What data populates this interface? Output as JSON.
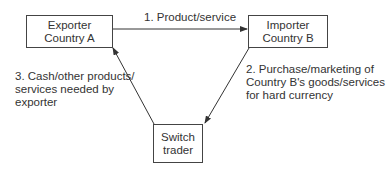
{
  "nodes": {
    "exporter": {
      "line1": "Exporter",
      "line2": "Country A"
    },
    "importer": {
      "line1": "Importer",
      "line2": "Country B"
    },
    "switch": {
      "line1": "Switch",
      "line2": "trader"
    }
  },
  "edges": {
    "e1": {
      "label": "1. Product/service"
    },
    "e2": {
      "line1": "2. Purchase/marketing of",
      "line2": "Country B's goods/services",
      "line3": "for hard currency"
    },
    "e3": {
      "line1": "3. Cash/other products/",
      "line2": "services needed by",
      "line3": "exporter"
    }
  }
}
